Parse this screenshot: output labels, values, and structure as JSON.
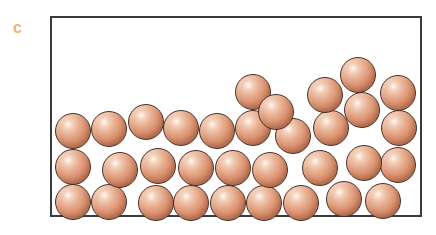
{
  "figure": {
    "panel_label": "c",
    "label_color": "#e8b878"
  },
  "container": {
    "name": "rectangular-container",
    "border_color": "#3b3b3d",
    "fill_color": "#ffffff",
    "x": 50,
    "y": 16,
    "width": 372,
    "height": 201,
    "border_width": 2
  },
  "particle_style": {
    "fill_color": "#d9906e",
    "highlight_color": "#ffffff",
    "shadow_color": "#a05c41",
    "outline_color": "#4a2f24",
    "diameter": 36
  },
  "chart_data": {
    "type": "scatter",
    "title": "",
    "xlabel": "",
    "ylabel": "",
    "xlim": [
      50,
      422
    ],
    "ylim": [
      16,
      217
    ],
    "grid": false,
    "legend": null,
    "particle_count": 33,
    "particles": [
      {
        "id": 1,
        "cx": 73,
        "cy": 202,
        "r": 18
      },
      {
        "id": 2,
        "cx": 109,
        "cy": 202,
        "r": 18
      },
      {
        "id": 3,
        "cx": 156,
        "cy": 203,
        "r": 18
      },
      {
        "id": 4,
        "cx": 191,
        "cy": 203,
        "r": 18
      },
      {
        "id": 5,
        "cx": 228,
        "cy": 203,
        "r": 18
      },
      {
        "id": 6,
        "cx": 264,
        "cy": 203,
        "r": 18
      },
      {
        "id": 7,
        "cx": 301,
        "cy": 203,
        "r": 18
      },
      {
        "id": 8,
        "cx": 344,
        "cy": 199,
        "r": 18
      },
      {
        "id": 9,
        "cx": 383,
        "cy": 201,
        "r": 18
      },
      {
        "id": 10,
        "cx": 73,
        "cy": 167,
        "r": 18
      },
      {
        "id": 11,
        "cx": 120,
        "cy": 170,
        "r": 18
      },
      {
        "id": 12,
        "cx": 158,
        "cy": 166,
        "r": 18
      },
      {
        "id": 13,
        "cx": 196,
        "cy": 168,
        "r": 18
      },
      {
        "id": 14,
        "cx": 233,
        "cy": 168,
        "r": 18
      },
      {
        "id": 15,
        "cx": 270,
        "cy": 170,
        "r": 18
      },
      {
        "id": 16,
        "cx": 320,
        "cy": 168,
        "r": 18
      },
      {
        "id": 17,
        "cx": 398,
        "cy": 165,
        "r": 18
      },
      {
        "id": 18,
        "cx": 73,
        "cy": 131,
        "r": 18
      },
      {
        "id": 19,
        "cx": 109,
        "cy": 129,
        "r": 18
      },
      {
        "id": 20,
        "cx": 146,
        "cy": 122,
        "r": 18
      },
      {
        "id": 21,
        "cx": 181,
        "cy": 128,
        "r": 18
      },
      {
        "id": 22,
        "cx": 217,
        "cy": 131,
        "r": 18
      },
      {
        "id": 23,
        "cx": 253,
        "cy": 128,
        "r": 18
      },
      {
        "id": 24,
        "cx": 293,
        "cy": 136,
        "r": 18
      },
      {
        "id": 25,
        "cx": 331,
        "cy": 128,
        "r": 18
      },
      {
        "id": 26,
        "cx": 362,
        "cy": 110,
        "r": 18
      },
      {
        "id": 27,
        "cx": 399,
        "cy": 128,
        "r": 18
      },
      {
        "id": 28,
        "cx": 253,
        "cy": 92,
        "r": 18
      },
      {
        "id": 29,
        "cx": 276,
        "cy": 112,
        "r": 18
      },
      {
        "id": 30,
        "cx": 325,
        "cy": 95,
        "r": 18
      },
      {
        "id": 31,
        "cx": 358,
        "cy": 75,
        "r": 18
      },
      {
        "id": 32,
        "cx": 398,
        "cy": 93,
        "r": 18
      },
      {
        "id": 33,
        "cx": 364,
        "cy": 163,
        "r": 18
      }
    ]
  }
}
